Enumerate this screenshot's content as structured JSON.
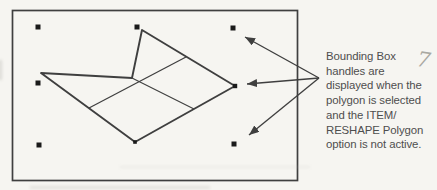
{
  "caption": {
    "lines": [
      "Bounding Box",
      "handles are",
      "displayed when the",
      "polygon is selected",
      "and the ITEM/",
      "RESHAPE Polygon",
      "option is not active."
    ]
  },
  "annotations": {
    "handwritten_mark": "7"
  },
  "colors": {
    "paper": "#f6f5f1",
    "ink": "#3f3f3f",
    "text": "#4e4e4e",
    "handle": "#1a1a1a",
    "pencil": "#a9a8a1"
  }
}
